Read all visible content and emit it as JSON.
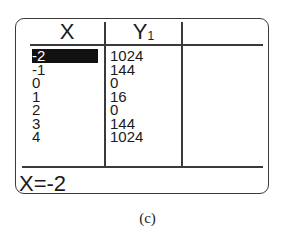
{
  "table": {
    "columns": [
      {
        "label": "X",
        "sub": ""
      },
      {
        "label": "Y",
        "sub": "1"
      },
      {
        "label": "",
        "sub": ""
      }
    ],
    "x_values": [
      "-2",
      "-1",
      "0",
      "1",
      "2",
      "3",
      "4"
    ],
    "y1_values": [
      "1024",
      "144",
      "0",
      "16",
      "0",
      "144",
      "1024"
    ],
    "selected_row": 0,
    "selected_column": "X"
  },
  "status_line": "X=-2",
  "caption": "(c)"
}
